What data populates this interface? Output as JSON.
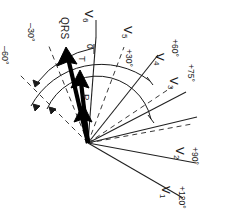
{
  "figure": {
    "type": "vector-diagram",
    "orientation_note": "all text rotated 90 degrees clockwise",
    "origin": {
      "x": 88,
      "y": 143
    }
  },
  "leads": [
    {
      "id": "v1",
      "name": "V",
      "sub": "1",
      "angle_label": "+120°",
      "angle_deg": 120,
      "style": "solid",
      "length": 110
    },
    {
      "id": "v2",
      "name": "V",
      "sub": "2",
      "angle_label": "+90°",
      "angle_deg": 90,
      "style": "solid",
      "length": 92
    },
    {
      "id": "v3",
      "name": "V",
      "sub": "3",
      "angle_label": "+75°",
      "angle_deg": 75,
      "style": "solid",
      "length": 96
    },
    {
      "id": "v4",
      "name": "V",
      "sub": "4",
      "angle_label": "+60°",
      "angle_deg": 60,
      "style": "solid",
      "length": 95
    },
    {
      "id": "v5",
      "name": "V",
      "sub": "5",
      "angle_label": "+30°",
      "angle_deg": 30,
      "style": "solid",
      "length": 100
    },
    {
      "id": "v6",
      "name": "V",
      "sub": "6",
      "angle_label": "0",
      "angle_deg": 0,
      "style": "solid",
      "length": 92
    }
  ],
  "reference_lines": [
    {
      "id": "minus30",
      "angle_label": "–30°",
      "angle_deg": -30,
      "style": "dashed"
    },
    {
      "id": "minus60",
      "angle_label": "–60°",
      "angle_deg": -60,
      "style": "dashed"
    }
  ],
  "extra_dashed": [
    {
      "id": "dash-a",
      "angle_deg": 15
    },
    {
      "id": "dash-b",
      "angle_deg": 45
    },
    {
      "id": "dash-c",
      "angle_deg": 68
    }
  ],
  "vectors": [
    {
      "id": "qrs",
      "label": "QRS",
      "angle_deg": -52,
      "length": 96
    },
    {
      "id": "t",
      "label": "T",
      "angle_deg": -62,
      "length": 72
    },
    {
      "id": "p",
      "label": "P",
      "angle_deg": -66,
      "length": 46
    }
  ],
  "colors": {
    "ink": "#1a1a1a",
    "background": "#ffffff",
    "thin_line": "#202020",
    "dashed_line": "#3a3a3a"
  }
}
